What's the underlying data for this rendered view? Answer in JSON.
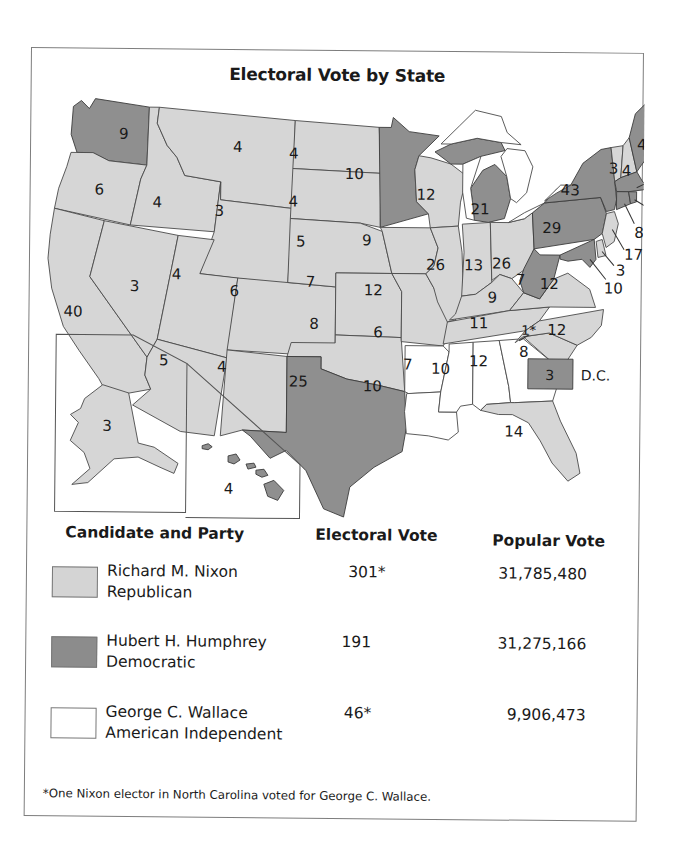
{
  "title": "Electoral Vote by State",
  "colors": {
    "republican": "#d4d4d4",
    "democratic": "#8c8c8c",
    "american_independent": "#ffffff",
    "border": "#4a4a4a"
  },
  "map": {
    "states": [
      {
        "name": "Washington",
        "votes": "9",
        "party": "dem"
      },
      {
        "name": "Oregon",
        "votes": "6",
        "party": "rep"
      },
      {
        "name": "California",
        "votes": "40",
        "party": "rep"
      },
      {
        "name": "Idaho",
        "votes": "4",
        "party": "rep"
      },
      {
        "name": "Nevada",
        "votes": "3",
        "party": "rep"
      },
      {
        "name": "Montana",
        "votes": "4",
        "party": "rep"
      },
      {
        "name": "Wyoming",
        "votes": "3",
        "party": "rep"
      },
      {
        "name": "Utah",
        "votes": "4",
        "party": "rep"
      },
      {
        "name": "Arizona",
        "votes": "5",
        "party": "rep"
      },
      {
        "name": "Colorado",
        "votes": "6",
        "party": "rep"
      },
      {
        "name": "New Mexico",
        "votes": "4",
        "party": "rep"
      },
      {
        "name": "North Dakota",
        "votes": "4",
        "party": "rep"
      },
      {
        "name": "South Dakota",
        "votes": "4",
        "party": "rep"
      },
      {
        "name": "Nebraska",
        "votes": "5",
        "party": "rep"
      },
      {
        "name": "Kansas",
        "votes": "7",
        "party": "rep"
      },
      {
        "name": "Oklahoma",
        "votes": "8",
        "party": "rep"
      },
      {
        "name": "Texas",
        "votes": "25",
        "party": "dem"
      },
      {
        "name": "Minnesota",
        "votes": "10",
        "party": "dem"
      },
      {
        "name": "Iowa",
        "votes": "9",
        "party": "rep"
      },
      {
        "name": "Missouri",
        "votes": "12",
        "party": "rep"
      },
      {
        "name": "Arkansas",
        "votes": "6",
        "party": "aip"
      },
      {
        "name": "Louisiana",
        "votes": "10",
        "party": "aip"
      },
      {
        "name": "Wisconsin",
        "votes": "12",
        "party": "rep"
      },
      {
        "name": "Illinois",
        "votes": "26",
        "party": "rep"
      },
      {
        "name": "Michigan",
        "votes": "21",
        "party": "dem"
      },
      {
        "name": "Indiana",
        "votes": "13",
        "party": "rep"
      },
      {
        "name": "Ohio",
        "votes": "26",
        "party": "rep"
      },
      {
        "name": "Kentucky",
        "votes": "9",
        "party": "rep"
      },
      {
        "name": "Tennessee",
        "votes": "11",
        "party": "rep"
      },
      {
        "name": "Mississippi",
        "votes": "7",
        "party": "aip"
      },
      {
        "name": "Alabama",
        "votes": "10",
        "party": "aip"
      },
      {
        "name": "Georgia",
        "votes": "12",
        "party": "aip"
      },
      {
        "name": "Florida",
        "votes": "14",
        "party": "rep"
      },
      {
        "name": "South Carolina",
        "votes": "8",
        "party": "rep"
      },
      {
        "name": "North Carolina",
        "votes": "12",
        "party": "rep",
        "split": "1*"
      },
      {
        "name": "Virginia",
        "votes": "12",
        "party": "rep"
      },
      {
        "name": "West Virginia",
        "votes": "7",
        "party": "dem"
      },
      {
        "name": "Pennsylvania",
        "votes": "29",
        "party": "dem"
      },
      {
        "name": "New York",
        "votes": "43",
        "party": "dem"
      },
      {
        "name": "Vermont",
        "votes": "3",
        "party": "rep"
      },
      {
        "name": "New Hampshire",
        "votes": "4",
        "party": "rep"
      },
      {
        "name": "Maine",
        "votes": "4",
        "party": "dem"
      },
      {
        "name": "Massachusetts",
        "votes": "14",
        "party": "dem"
      },
      {
        "name": "Rhode Island",
        "votes": "4",
        "party": "dem"
      },
      {
        "name": "Connecticut",
        "votes": "8",
        "party": "dem"
      },
      {
        "name": "New Jersey",
        "votes": "17",
        "party": "rep"
      },
      {
        "name": "Delaware",
        "votes": "3",
        "party": "rep"
      },
      {
        "name": "Maryland",
        "votes": "10",
        "party": "dem"
      },
      {
        "name": "Alaska",
        "votes": "3",
        "party": "rep"
      },
      {
        "name": "Hawaii",
        "votes": "4",
        "party": "dem"
      }
    ],
    "dc": {
      "votes": "3",
      "label": "D.C.",
      "party": "dem"
    }
  },
  "legend": {
    "headers": {
      "candidate": "Candidate and Party",
      "electoral": "Electoral Vote",
      "popular": "Popular Vote"
    },
    "rows": [
      {
        "candidate": "Richard M. Nixon",
        "party": "Republican",
        "electoral": "301*",
        "popular": "31,785,480",
        "swatch": "rep"
      },
      {
        "candidate": "Hubert H. Humphrey",
        "party": "Democratic",
        "electoral": "191",
        "popular": "31,275,166",
        "swatch": "dem"
      },
      {
        "candidate": "George C. Wallace",
        "party": "American Independent",
        "electoral": "46*",
        "popular": "9,906,473",
        "swatch": "aip"
      }
    ]
  },
  "footnote": "*One Nixon elector in North Carolina voted for George C. Wallace."
}
